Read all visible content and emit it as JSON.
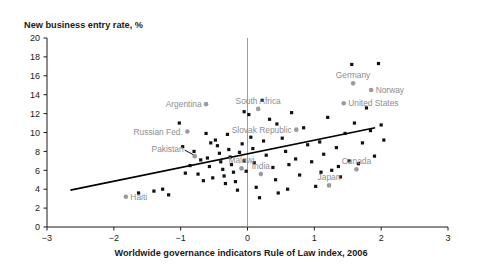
{
  "chart_data": {
    "type": "scatter",
    "title": "",
    "ylabel": "New business entry rate, %",
    "xlabel": "Worldwide governance indicators Rule of Law index, 2006",
    "xlim": [
      -3,
      3
    ],
    "ylim": [
      0,
      20
    ],
    "xticks": [
      "−3",
      "−2",
      "−1",
      "0",
      "1",
      "2",
      "3"
    ],
    "xtick_values": [
      -3,
      -2,
      -1,
      0,
      1,
      2,
      3
    ],
    "yticks": [
      "0",
      "2",
      "4",
      "6",
      "8",
      "10",
      "12",
      "14",
      "16",
      "18",
      "20"
    ],
    "ytick_values": [
      0,
      2,
      4,
      6,
      8,
      10,
      12,
      14,
      16,
      18,
      20
    ],
    "grid": false,
    "legend": null,
    "zero_line_x": 0,
    "trendline": {
      "x_start": -2.65,
      "y_start": 3.9,
      "x_end": 1.91,
      "y_end": 10.5,
      "color": "#000000"
    },
    "labeled_points": [
      {
        "name": "Argentina",
        "x": -0.62,
        "y": 13.0,
        "label_side": "left"
      },
      {
        "name": "South Africa",
        "x": 0.16,
        "y": 12.5,
        "label_side": "above"
      },
      {
        "name": "Germany",
        "x": 1.58,
        "y": 15.2,
        "label_side": "above"
      },
      {
        "name": "Norway",
        "x": 1.85,
        "y": 14.5,
        "label_side": "right"
      },
      {
        "name": "United States",
        "x": 1.44,
        "y": 13.1,
        "label_side": "right"
      },
      {
        "name": "Russian Fed.",
        "x": -0.9,
        "y": 10.1,
        "label_side": "left"
      },
      {
        "name": "Slovak Republic",
        "x": 0.73,
        "y": 10.3,
        "label_side": "left"
      },
      {
        "name": "Pakistan",
        "x": -0.79,
        "y": 7.5,
        "label_side": "leader"
      },
      {
        "name": "Malawi",
        "x": -0.09,
        "y": 6.2,
        "label_side": "above"
      },
      {
        "name": "India",
        "x": 0.2,
        "y": 5.6,
        "label_side": "above"
      },
      {
        "name": "Japan",
        "x": 1.22,
        "y": 4.4,
        "label_side": "above"
      },
      {
        "name": "Canada",
        "x": 1.63,
        "y": 6.1,
        "label_side": "above"
      },
      {
        "name": "Haiti",
        "x": -1.82,
        "y": 3.2,
        "label_side": "right"
      }
    ],
    "points": [
      {
        "x": -1.63,
        "y": 3.6
      },
      {
        "x": -1.4,
        "y": 3.8
      },
      {
        "x": -1.27,
        "y": 4.0
      },
      {
        "x": -1.18,
        "y": 3.4
      },
      {
        "x": -1.02,
        "y": 11.0
      },
      {
        "x": -0.97,
        "y": 8.5
      },
      {
        "x": -0.93,
        "y": 5.7
      },
      {
        "x": -0.86,
        "y": 6.5
      },
      {
        "x": -0.8,
        "y": 8.0
      },
      {
        "x": -0.74,
        "y": 5.6
      },
      {
        "x": -0.7,
        "y": 7.1
      },
      {
        "x": -0.66,
        "y": 4.9
      },
      {
        "x": -0.6,
        "y": 7.3
      },
      {
        "x": -0.57,
        "y": 6.4
      },
      {
        "x": -0.52,
        "y": 5.2
      },
      {
        "x": -0.48,
        "y": 9.2
      },
      {
        "x": -0.45,
        "y": 8.6
      },
      {
        "x": -0.42,
        "y": 7.8
      },
      {
        "x": -0.4,
        "y": 6.9
      },
      {
        "x": -0.37,
        "y": 6.1
      },
      {
        "x": -0.35,
        "y": 5.4
      },
      {
        "x": -0.33,
        "y": 4.6
      },
      {
        "x": -0.3,
        "y": 9.8
      },
      {
        "x": -0.28,
        "y": 8.2
      },
      {
        "x": -0.26,
        "y": 7.4
      },
      {
        "x": -0.24,
        "y": 6.6
      },
      {
        "x": -0.21,
        "y": 5.8
      },
      {
        "x": -0.18,
        "y": 4.8
      },
      {
        "x": -0.15,
        "y": 3.9
      },
      {
        "x": -0.12,
        "y": 7.9
      },
      {
        "x": -0.08,
        "y": 8.8
      },
      {
        "x": -0.05,
        "y": 7.0
      },
      {
        "x": -0.02,
        "y": 5.9
      },
      {
        "x": 0.02,
        "y": 11.9
      },
      {
        "x": 0.05,
        "y": 9.5
      },
      {
        "x": 0.08,
        "y": 8.3
      },
      {
        "x": 0.1,
        "y": 6.8
      },
      {
        "x": 0.13,
        "y": 4.2
      },
      {
        "x": 0.18,
        "y": 3.1
      },
      {
        "x": 0.24,
        "y": 9.1
      },
      {
        "x": 0.28,
        "y": 7.6
      },
      {
        "x": 0.33,
        "y": 11.4
      },
      {
        "x": 0.38,
        "y": 6.3
      },
      {
        "x": 0.42,
        "y": 5.0
      },
      {
        "x": 0.46,
        "y": 3.6
      },
      {
        "x": 0.52,
        "y": 9.4
      },
      {
        "x": 0.57,
        "y": 8.0
      },
      {
        "x": 0.62,
        "y": 6.6
      },
      {
        "x": 0.66,
        "y": 12.1
      },
      {
        "x": 0.72,
        "y": 7.2
      },
      {
        "x": 0.78,
        "y": 5.5
      },
      {
        "x": 0.84,
        "y": 10.5
      },
      {
        "x": 0.9,
        "y": 8.7
      },
      {
        "x": 0.96,
        "y": 6.9
      },
      {
        "x": 1.02,
        "y": 4.3
      },
      {
        "x": 1.08,
        "y": 9.0
      },
      {
        "x": 1.14,
        "y": 7.7
      },
      {
        "x": 1.2,
        "y": 11.6
      },
      {
        "x": 1.26,
        "y": 6.0
      },
      {
        "x": 1.33,
        "y": 8.4
      },
      {
        "x": 1.39,
        "y": 5.3
      },
      {
        "x": 1.46,
        "y": 9.9
      },
      {
        "x": 1.52,
        "y": 7.0
      },
      {
        "x": 1.56,
        "y": 17.2
      },
      {
        "x": 1.6,
        "y": 11.0
      },
      {
        "x": 1.66,
        "y": 6.7
      },
      {
        "x": 1.72,
        "y": 8.9
      },
      {
        "x": 1.78,
        "y": 12.6
      },
      {
        "x": 1.84,
        "y": 10.2
      },
      {
        "x": 1.9,
        "y": 7.5
      },
      {
        "x": 1.96,
        "y": 17.3
      },
      {
        "x": 2.0,
        "y": 10.8
      },
      {
        "x": 2.04,
        "y": 9.2
      },
      {
        "x": 0.44,
        "y": 10.9
      },
      {
        "x": 0.22,
        "y": 13.4
      },
      {
        "x": -0.05,
        "y": 12.2
      },
      {
        "x": 1.1,
        "y": 5.8
      },
      {
        "x": 1.36,
        "y": 6.4
      },
      {
        "x": 0.6,
        "y": 4.0
      },
      {
        "x": -0.62,
        "y": 9.9
      },
      {
        "x": -0.55,
        "y": 8.9
      }
    ]
  },
  "decor": {
    "top_cut_text": "· · · · · · · · · · · · · · · · · · · · · · · · · · · · · · · · · · · · · · · · · ·"
  }
}
